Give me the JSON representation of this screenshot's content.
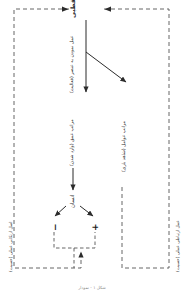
{
  "diagram": {
    "title": "هیچ قطبی",
    "language": "fa",
    "orientation": "rotated-90",
    "nodes": {
      "root_label": "هیچ قطبی",
      "human_label": "انسان",
      "plus_label": "+",
      "minus_label": "−"
    },
    "edges": {
      "edge_activity": "عمل نمودن به عنصر (فعالیت)",
      "edge_depth": "مراتب عمق (وارد شدن)",
      "edge_factors": "مراتب عوامل (شاهد بازی)"
    },
    "loops": {
      "left_label": "اصل ارتکابی عملی (حسیت)",
      "right_label": "عمل ارتباطی عملی (حسیت)"
    },
    "caption": "شکل ۱ - نمودار"
  },
  "colors": {
    "stroke": "#2b2b2b",
    "dashed": "#555555",
    "text": "#2b2b2b",
    "muted": "#8a8a8a",
    "background": "#ffffff"
  }
}
